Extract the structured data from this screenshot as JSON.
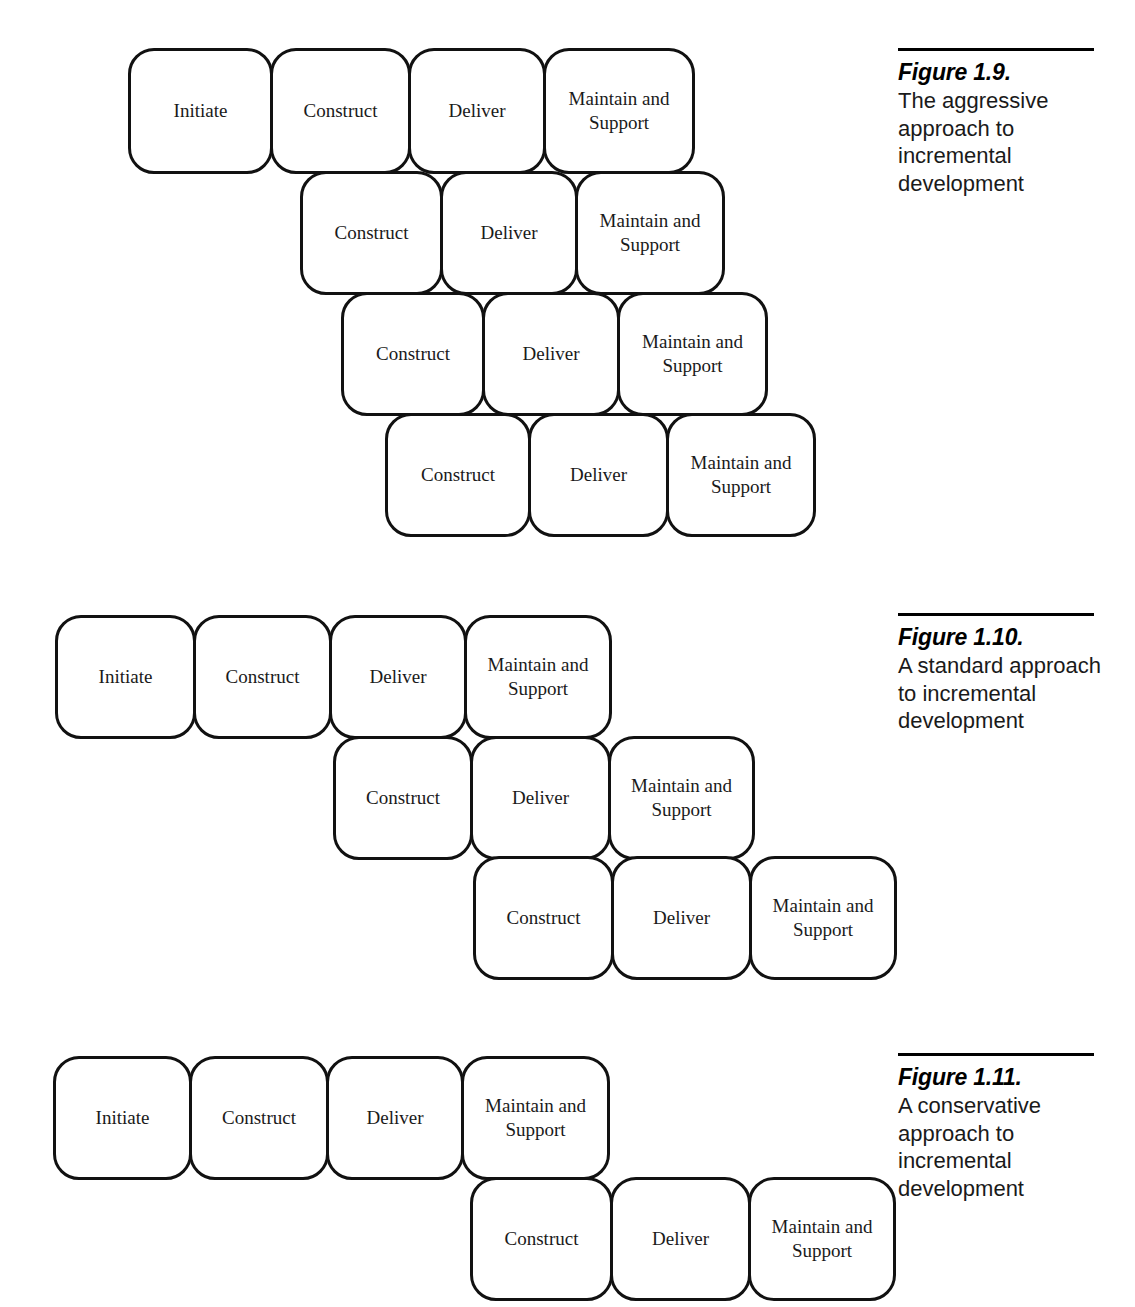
{
  "page": {
    "background": "#ffffff",
    "ink": "#000000",
    "width": 1135,
    "height": 1307
  },
  "figures": [
    {
      "id": "figure-1-9",
      "caption": {
        "number": "Figure 1.9.",
        "text": "The aggressive approach to incremental development"
      },
      "rows": [
        {
          "boxes": [
            "Initiate",
            "Construct",
            "Deliver",
            "Maintain and\nSupport"
          ]
        },
        {
          "boxes": [
            "Construct",
            "Deliver",
            "Maintain and\nSupport"
          ]
        },
        {
          "boxes": [
            "Construct",
            "Deliver",
            "Maintain and\nSupport"
          ]
        },
        {
          "boxes": [
            "Construct",
            "Deliver",
            "Maintain and\nSupport"
          ]
        }
      ]
    },
    {
      "id": "figure-1-10",
      "caption": {
        "number": "Figure 1.10.",
        "text": "A standard approach to incremental development"
      },
      "rows": [
        {
          "boxes": [
            "Initiate",
            "Construct",
            "Deliver",
            "Maintain and\nSupport"
          ]
        },
        {
          "boxes": [
            "Construct",
            "Deliver",
            "Maintain and\nSupport"
          ]
        },
        {
          "boxes": [
            "Construct",
            "Deliver",
            "Maintain and\nSupport"
          ]
        }
      ]
    },
    {
      "id": "figure-1-11",
      "caption": {
        "number": "Figure 1.11.",
        "text": "A conservative approach to incremental development"
      },
      "rows": [
        {
          "boxes": [
            "Initiate",
            "Construct",
            "Deliver",
            "Maintain and\nSupport"
          ]
        },
        {
          "boxes": [
            "Construct",
            "Deliver",
            "Maintain and\nSupport"
          ]
        }
      ]
    }
  ]
}
